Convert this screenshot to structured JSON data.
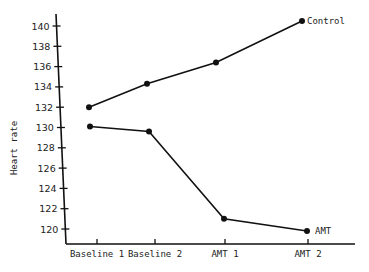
{
  "chart_data": {
    "type": "line",
    "title": "",
    "xlabel": "",
    "ylabel": "Heart rate",
    "categories": [
      "Baseline 1",
      "Baseline 2",
      "AMT 1",
      "AMT 2"
    ],
    "series": [
      {
        "name": "Control",
        "values": [
          132.0,
          134.3,
          136.4,
          140.5
        ]
      },
      {
        "name": "AMT",
        "values": [
          130.1,
          129.6,
          121.0,
          119.8
        ]
      }
    ],
    "yticks": [
      120,
      122,
      124,
      126,
      128,
      130,
      132,
      134,
      136,
      138,
      140
    ],
    "ylim": [
      118.5,
      142
    ],
    "grid": false,
    "legend": "inline labels at series ends"
  },
  "labels": {
    "ylabel": "Heart rate",
    "control": "Control",
    "amt": "AMT",
    "x": [
      "Baseline 1",
      "Baseline 2",
      "AMT 1",
      "AMT 2"
    ],
    "y": [
      "120",
      "122",
      "124",
      "126",
      "128",
      "130",
      "132",
      "134",
      "136",
      "138",
      "140"
    ]
  }
}
